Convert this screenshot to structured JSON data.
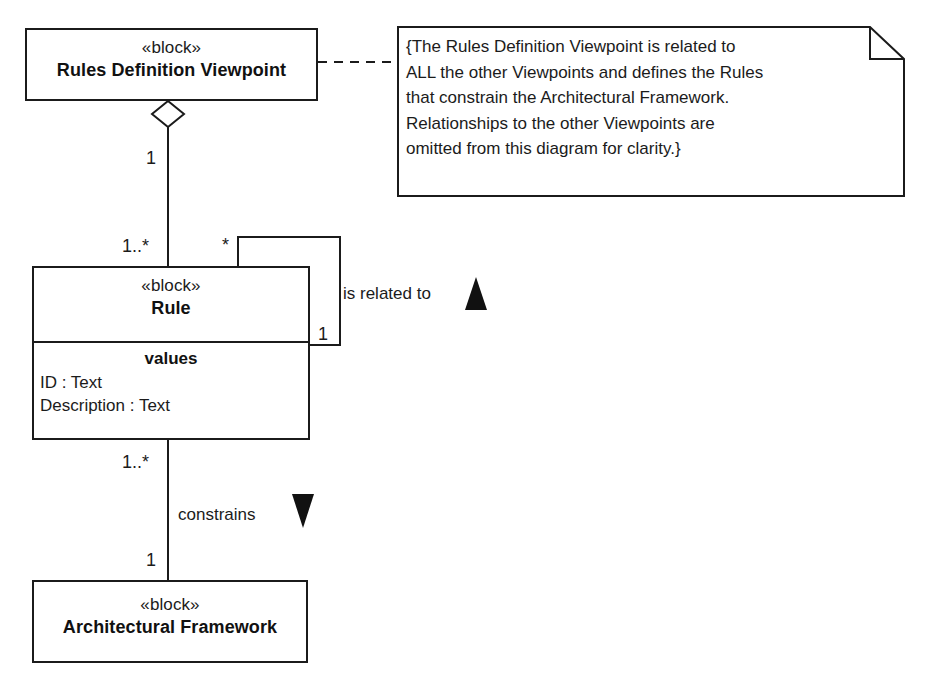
{
  "diagram": {
    "type": "sysml-block-definition-diagram",
    "background_color": "#ffffff",
    "line_color": "#1b1b1b"
  },
  "blocks": [
    {
      "id": "rules-definition-viewpoint",
      "stereotype": "«block»",
      "name": "Rules Definition Viewpoint"
    },
    {
      "id": "rule",
      "stereotype": "«block»",
      "name": "Rule",
      "compartment_title": "values",
      "properties": [
        "ID : Text",
        "Description : Text"
      ]
    },
    {
      "id": "architectural-framework",
      "stereotype": "«block»",
      "name": "Architectural Framework"
    }
  ],
  "note": {
    "text": "{The Rules Definition Viewpoint is related to\nALL the other Viewpoints and defines the Rules\nthat constrain the Architectural Framework.\nRelationships to the other Viewpoints are\nomitted from this diagram for clarity.}"
  },
  "relationships": {
    "aggregation": {
      "source_multiplicity": "1",
      "target_multiplicity": "1..*"
    },
    "self_association": {
      "label": "is related to",
      "direction_marker": "triangle-up",
      "end_multiplicity": "*",
      "start_multiplicity": "1"
    },
    "constrains_association": {
      "label": "constrains",
      "direction_marker": "triangle-down",
      "source_multiplicity": "1..*",
      "target_multiplicity": "1"
    }
  }
}
